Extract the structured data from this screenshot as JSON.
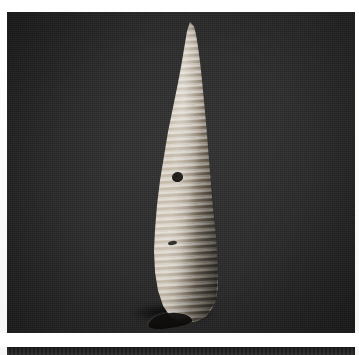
{
  "page": {
    "kind": "photographic-plate-scan",
    "background_color": "#fdfdfc",
    "margins": {
      "top_px": 12,
      "left_px": 7,
      "right_px": 4,
      "gutter_px": 14
    }
  },
  "plate": {
    "label": "",
    "background_color": "#242424",
    "width_px": 348,
    "height_px": 321,
    "description": "Dark matte photographic backdrop"
  },
  "specimen": {
    "name": "gastropod-shell",
    "common_description": "High-spired turreted gastropod shell (turritellid / cerithioid form)",
    "orientation": "apex up, aperture down-left",
    "surface_color_light": "#d9d2c5",
    "surface_color_mid": "#a89f92",
    "surface_color_dark": "#39352f",
    "features": [
      {
        "name": "apex",
        "label": "pointed apex"
      },
      {
        "name": "spiral-ribs",
        "label": "spiral ribbing / whorl bands"
      },
      {
        "name": "bore-hole",
        "label": "dark perforation on body whorl"
      },
      {
        "name": "chip",
        "label": "small chipped nick"
      },
      {
        "name": "aperture",
        "label": "aperture opening at base"
      },
      {
        "name": "cast-shadow",
        "label": "cast shadow beneath base"
      }
    ]
  },
  "next_plate": {
    "label": "",
    "background_color": "#1f1f1f",
    "description": "Top edge of the following photographic plate"
  }
}
